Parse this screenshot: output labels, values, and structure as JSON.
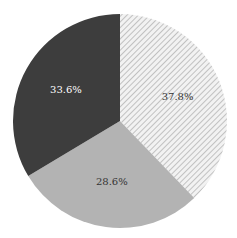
{
  "chart_data": {
    "type": "pie",
    "title": "",
    "start_angle": "12 o'clock, clockwise",
    "slices": [
      {
        "label": "37.8%",
        "value": 37.8,
        "color": "#e8e8e8",
        "pattern": "diagonal-hatch",
        "text_color": "#333333"
      },
      {
        "label": "28.6%",
        "value": 28.6,
        "color": "#b3b3b3",
        "pattern": "solid",
        "text_color": "#333333"
      },
      {
        "label": "33.6%",
        "value": 33.6,
        "color": "#3d3d3d",
        "pattern": "solid",
        "text_color": "#ffffff"
      }
    ],
    "legend": []
  }
}
